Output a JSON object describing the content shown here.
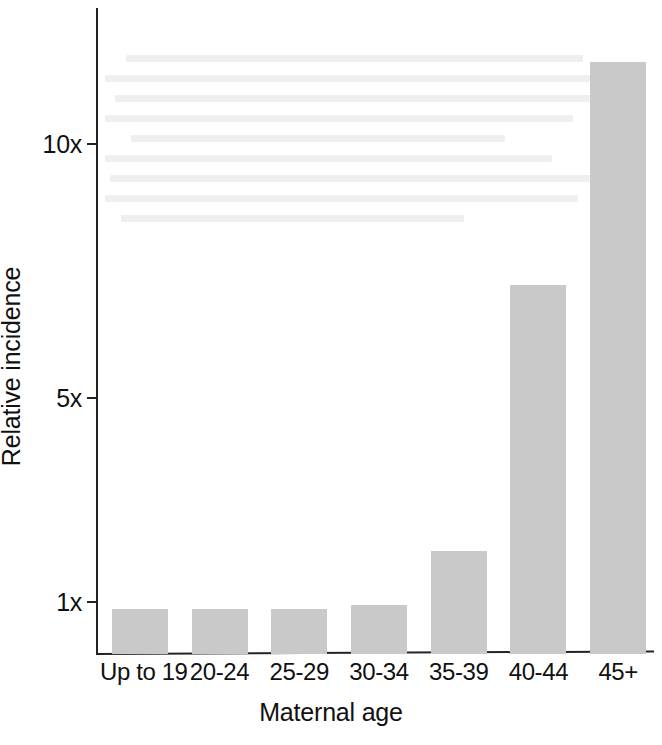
{
  "chart_data": {
    "type": "bar",
    "title": "",
    "subtitle": "",
    "xlabel": "Maternal age",
    "ylabel": "Relative incidence",
    "categories": [
      "Up to 19",
      "20-24",
      "25-29",
      "30-34",
      "35-39",
      "40-44",
      "45+"
    ],
    "values": [
      0.95,
      0.95,
      0.95,
      0.98,
      1.5,
      6.8,
      12.5
    ],
    "value_labels": [
      "",
      "",
      "",
      "",
      "",
      "",
      ""
    ],
    "series": [
      {
        "name": "Relative incidence",
        "values": [
          0.95,
          0.95,
          0.95,
          0.98,
          1.5,
          6.8,
          12.5
        ]
      }
    ],
    "ytick_labels": [
      "1x",
      "5x",
      "10x"
    ],
    "ytick_values": [
      1,
      5,
      10
    ],
    "ylim": [
      0.78,
      13.1
    ],
    "xlim": null,
    "grid": false,
    "legend": false,
    "legend_position": "none",
    "bar_color": "#c9c9c9",
    "axis_color": "#232323",
    "annotations": []
  },
  "axes": {
    "y_title": "Relative incidence",
    "x_title": "Maternal age"
  },
  "ghost_text_lines": 9
}
